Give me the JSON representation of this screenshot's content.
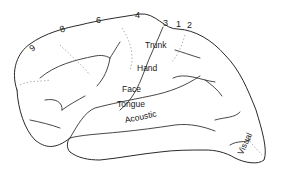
{
  "figure": {
    "colors": {
      "background": "#ffffff",
      "line": "#2a2a2a",
      "boundary": "#9a9a9a"
    }
  },
  "area_numbers": [
    {
      "label": "9",
      "x": 30,
      "y": 44,
      "rotate": -35
    },
    {
      "label": "8",
      "x": 60,
      "y": 25,
      "rotate": -20
    },
    {
      "label": "6",
      "x": 96,
      "y": 16,
      "rotate": 0
    },
    {
      "label": "4",
      "x": 135,
      "y": 11,
      "rotate": 0
    },
    {
      "label": "3",
      "x": 163,
      "y": 19,
      "rotate": 0
    },
    {
      "label": "1",
      "x": 176,
      "y": 20,
      "rotate": 0
    },
    {
      "label": "2",
      "x": 187,
      "y": 21,
      "rotate": 0
    }
  ],
  "region_labels": [
    {
      "label": "Trunk",
      "x": 145,
      "y": 41,
      "rotate": 0
    },
    {
      "label": "Hand",
      "x": 137,
      "y": 64,
      "rotate": 0
    },
    {
      "label": "Face",
      "x": 122,
      "y": 85,
      "rotate": 0
    },
    {
      "label": "Tongue",
      "x": 117,
      "y": 100,
      "rotate": 0
    },
    {
      "label": "Acoustic",
      "x": 125,
      "y": 116,
      "rotate": -12
    },
    {
      "label": "Visual",
      "x": 244,
      "y": 146,
      "rotate": -65
    }
  ]
}
